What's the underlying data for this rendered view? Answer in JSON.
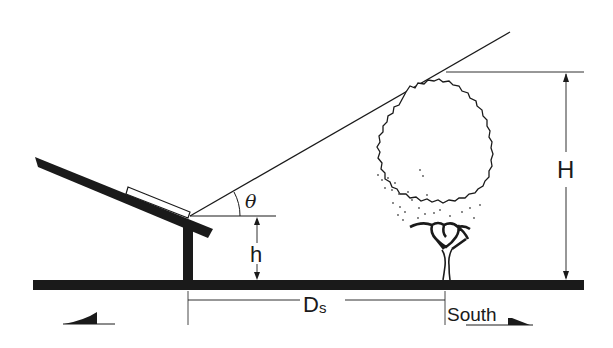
{
  "diagram": {
    "labels": {
      "angle": "θ",
      "panel_height": "h",
      "tree_height": "H",
      "distance_main": "D",
      "distance_sub": "s",
      "direction": "South"
    },
    "elements": {
      "ground": "ground-line",
      "mount_post": "vertical support post",
      "tilted_beam": "tilted mounting beam",
      "solar_panel": "solar panel",
      "sun_ray": "sun ray line",
      "obstruction": "tree"
    },
    "colors": {
      "ink": "#1a1a1a",
      "background": "#ffffff"
    }
  }
}
